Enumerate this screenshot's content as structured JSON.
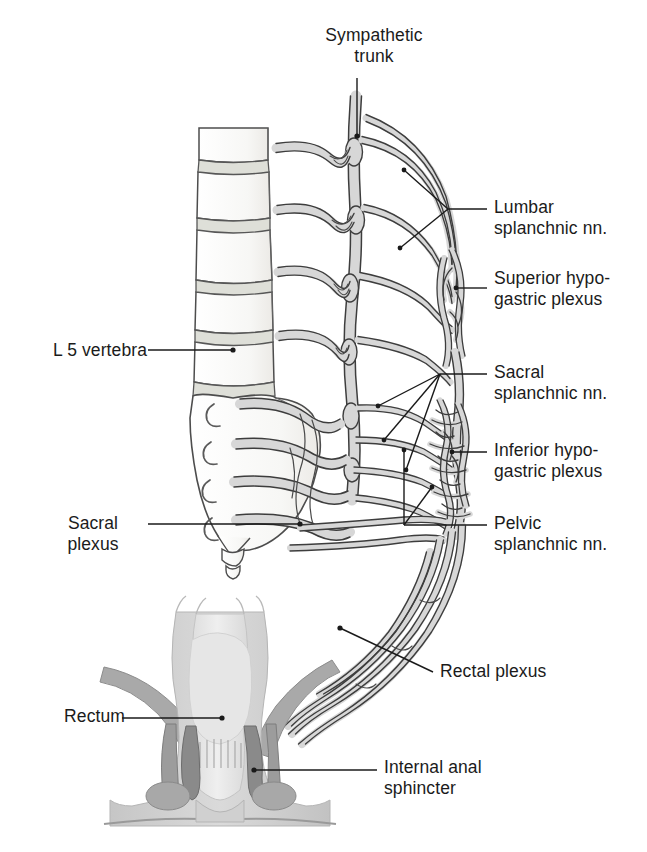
{
  "figure": {
    "view": "Left lateral view of lumbosacral spine with coronal section of rectum",
    "colors": {
      "nerve_fill": "#d7d7d7",
      "nerve_outline": "#3a3a3a",
      "bone_fill": "#fbfbfb",
      "bone_outline": "#4a4a4a",
      "disc_fill": "#dcdcd6",
      "rectum_wall": "#d2d2d2",
      "rectum_lumen": "#e8e8e8",
      "internal_sphincter": "#8a8a8a",
      "external_sphincter": "#b0b0b0",
      "leader_line": "#1a1a1a",
      "label_text": "#1b1b1b",
      "background": "#ffffff"
    }
  },
  "labels": {
    "sympathetic_trunk": {
      "text": "Sympathetic\ntrunk",
      "align": "center",
      "x": 304,
      "y": 25,
      "width": 140
    },
    "lumbar_splanchnic": {
      "text": "Lumbar\nsplanchnic nn.",
      "align": "right",
      "x": 494,
      "y": 197,
      "width": 152
    },
    "superior_hypogastric": {
      "text": "Superior hypo-\ngastric plexus",
      "align": "right",
      "x": 494,
      "y": 268,
      "width": 152
    },
    "l5_vertebra": {
      "text": "L 5 vertebra",
      "align": "left",
      "x": 27,
      "y": 340,
      "width": 120
    },
    "sacral_splanchnic": {
      "text": "Sacral\nsplanchnic nn.",
      "align": "right",
      "x": 494,
      "y": 362,
      "width": 152
    },
    "inferior_hypogastric": {
      "text": "Inferior hypo-\ngastric plexus",
      "align": "right",
      "x": 494,
      "y": 440,
      "width": 152
    },
    "pelvic_splanchnic": {
      "text": "Pelvic\nsplanchnic nn.",
      "align": "right",
      "x": 494,
      "y": 513,
      "width": 152
    },
    "sacral_plexus": {
      "text": "Sacral\nplexus",
      "align": "center",
      "x": 38,
      "y": 513,
      "width": 110
    },
    "rectal_plexus": {
      "text": "Rectal plexus",
      "align": "right",
      "x": 440,
      "y": 661,
      "width": 160
    },
    "rectum": {
      "text": "Rectum",
      "align": "left",
      "x": 30,
      "y": 706,
      "width": 95
    },
    "internal_anal_sphincter": {
      "text": "Internal anal\nsphincter",
      "align": "right",
      "x": 384,
      "y": 757,
      "width": 160
    }
  },
  "structures": [
    {
      "name": "lumbar-vertebral-bodies",
      "count": 5,
      "description": "Stacked lumbar vertebral bodies L1-L5"
    },
    {
      "name": "intervertebral-discs",
      "count": 4,
      "description": "Gray bands between vertebral bodies"
    },
    {
      "name": "sacrum",
      "description": "Sacral bone with four anterior sacral foramina"
    },
    {
      "name": "sacral-foramina",
      "count": 4,
      "description": "Crescent-shaped openings on sacrum"
    },
    {
      "name": "coccyx",
      "description": "Small terminal bone below sacrum"
    },
    {
      "name": "sympathetic-trunk",
      "description": "Vertical nerve chain with ganglia lateral to vertebral bodies"
    },
    {
      "name": "lumbar-splanchnic-nerves",
      "count": 4,
      "description": "Nerves from lumbar ganglia to superior hypogastric plexus"
    },
    {
      "name": "superior-hypogastric-plexus",
      "description": "Nerve plexus anterior to sacral promontory"
    },
    {
      "name": "sacral-splanchnic-nerves",
      "count": 4,
      "description": "Nerves from sacral ganglia to inferior hypogastric plexus"
    },
    {
      "name": "inferior-hypogastric-plexus",
      "description": "Dense mesh plexus in pelvis"
    },
    {
      "name": "pelvic-splanchnic-nerves",
      "description": "Parasympathetic nerves from S2-S4"
    },
    {
      "name": "sacral-plexus",
      "description": "Somatic plexus from sacral nerve roots"
    },
    {
      "name": "rectal-plexus",
      "description": "Nerve bundles descending to rectum"
    },
    {
      "name": "rectum",
      "description": "Coronal section of rectum and anal canal"
    },
    {
      "name": "anal-columns",
      "description": "Vertical mucosal folds in anal canal"
    },
    {
      "name": "internal-anal-sphincter",
      "description": "Dark gray smooth muscle ring"
    },
    {
      "name": "external-anal-sphincter",
      "description": "Oval skeletal muscle bundles"
    }
  ]
}
